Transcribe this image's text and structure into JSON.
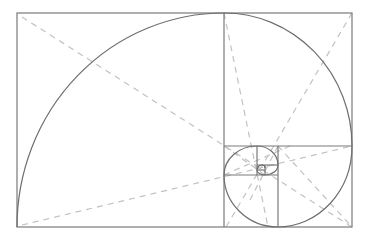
{
  "diagram": {
    "colors": {
      "background": "#ffffff",
      "square_lines": "#7a7a7a",
      "spiral": "#6e6e6e",
      "diagonals": "#c2c2c2"
    },
    "outer_rect": {
      "x": 17,
      "y": 13,
      "width": 335,
      "height": 214
    },
    "squares": [
      {
        "x": 17,
        "y": 13,
        "w": 207,
        "h": 214
      },
      {
        "x": 224,
        "y": 13,
        "w": 128,
        "h": 133
      },
      {
        "x": 278,
        "y": 146,
        "w": 74,
        "h": 81
      },
      {
        "x": 224,
        "y": 175,
        "w": 54,
        "h": 52
      },
      {
        "x": 224,
        "y": 146,
        "w": 33,
        "h": 29
      },
      {
        "x": 257,
        "y": 146,
        "w": 21,
        "h": 19
      },
      {
        "x": 265,
        "y": 165,
        "w": 13,
        "h": 10
      },
      {
        "x": 257,
        "y": 165,
        "w": 8,
        "h": 10
      }
    ],
    "spiral_label": "Fibonacci spiral",
    "diagonal_label": "Diagonal guide lines"
  }
}
